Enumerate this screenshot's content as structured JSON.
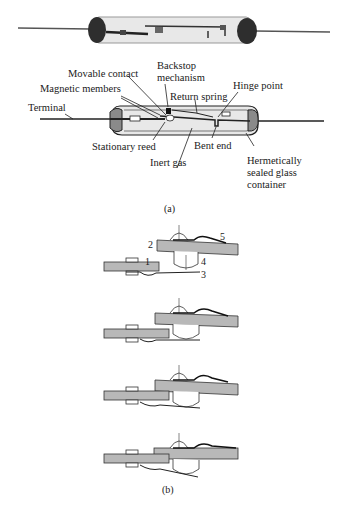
{
  "figure_a": {
    "caption": "(a)",
    "labels": {
      "movable_contact": "Movable contact",
      "backstop_line1": "Backstop",
      "backstop_line2": "mechanism",
      "magnetic_members": "Magnetic members",
      "return_spring": "Return spring",
      "hinge_point": "Hinge point",
      "terminal": "Terminal",
      "stationary_reed": "Stationary reed",
      "bent_end": "Bent end",
      "inert_gas": "Inert gas",
      "glass_line1": "Hermetically",
      "glass_line2": "sealed glass",
      "glass_line3": "container"
    }
  },
  "figure_b": {
    "caption": "(b)",
    "part_numbers": [
      "1",
      "2",
      "3",
      "4",
      "5"
    ],
    "stages": 4
  },
  "colors": {
    "ink": "#1a1a1a",
    "plate_gray": "#b8b8b8",
    "glass_gray": "#d9d9d9",
    "end_cap_dark": "#3a3a3a"
  }
}
